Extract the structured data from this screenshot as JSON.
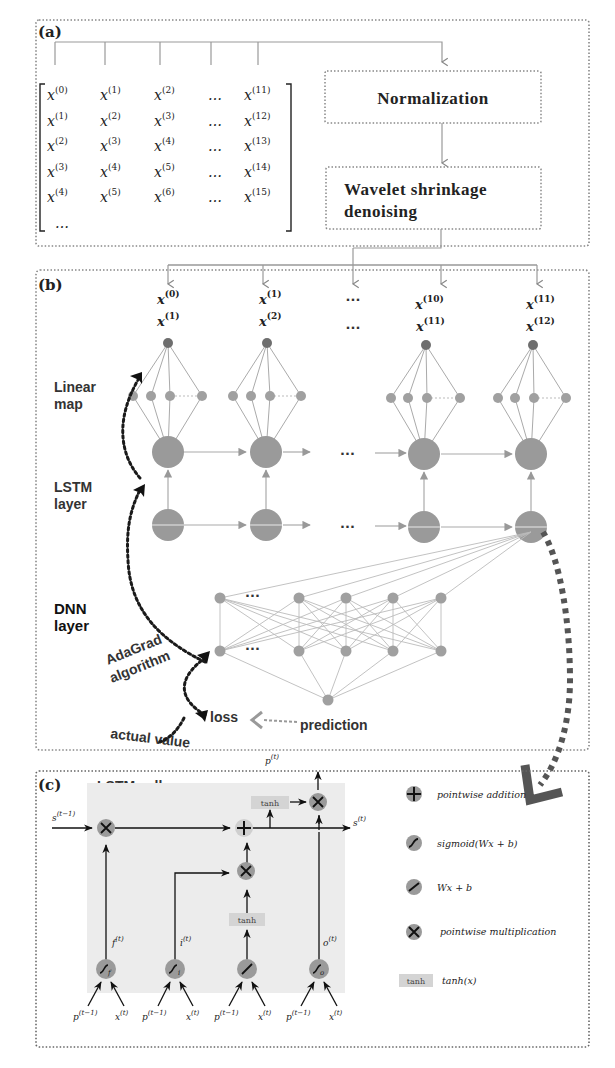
{
  "figure": {
    "panels": [
      {
        "id": "a",
        "label": "(a)"
      },
      {
        "id": "b",
        "label": "(b)"
      },
      {
        "id": "c",
        "label": "(c)"
      }
    ]
  },
  "panel_a": {
    "label": "(a)",
    "matrix": {
      "rows": [
        [
          "0",
          "1",
          "2",
          "…",
          "11"
        ],
        [
          "1",
          "2",
          "3",
          "…",
          "12"
        ],
        [
          "2",
          "3",
          "4",
          "…",
          "13"
        ],
        [
          "3",
          "4",
          "5",
          "…",
          "14"
        ],
        [
          "4",
          "5",
          "6",
          "…",
          "15"
        ]
      ],
      "trailing": "…",
      "variable": "x"
    },
    "boxes": {
      "normalization": "Normalization",
      "wavelet_line1": "Wavelet shrinkage",
      "wavelet_line2": "denoising"
    }
  },
  "panel_b": {
    "label": "(b)",
    "inputs": [
      {
        "top": "0",
        "bottom": "1"
      },
      {
        "top": "1",
        "bottom": "2"
      },
      {
        "top": "…",
        "bottom": "…"
      },
      {
        "top": "10",
        "bottom": "11"
      },
      {
        "top": "11",
        "bottom": "12"
      }
    ],
    "variable": "x",
    "labels": {
      "linear_map_1": "Linear",
      "linear_map_2": "map",
      "lstm_layer_1": "LSTM",
      "lstm_layer_2": "layer",
      "dnn_layer_1": "DNN",
      "dnn_layer_2": "layer",
      "adagrad_1": "AdaGrad",
      "adagrad_2": "algorithm",
      "loss": "loss",
      "prediction": "prediction",
      "actual_value": "actual value",
      "ellipsis": "···"
    }
  },
  "panel_c": {
    "label": "(c)",
    "title": "LSTM cell",
    "cell": {
      "state_in": "s",
      "state_in_sup": "(t−1)",
      "state_out": "s",
      "state_out_sup": "(t)",
      "output": "p",
      "output_sup": "(t)",
      "tanh_label": "tanh",
      "gates": [
        {
          "name": "forget",
          "label": "f",
          "sup": "(t)",
          "sub": "f"
        },
        {
          "name": "input",
          "label": "i",
          "sup": "(t)",
          "sub": "i"
        },
        {
          "name": "candidate",
          "label": "",
          "sup": "",
          "sub": ""
        },
        {
          "name": "output",
          "label": "o",
          "sup": "(t)",
          "sub": "o"
        }
      ],
      "inputs": {
        "prev": "p",
        "prev_sup": "(t−1)",
        "x": "x",
        "x_sup": "(t)"
      }
    },
    "legend": [
      {
        "icon": "plus",
        "text": "pointwise addition"
      },
      {
        "icon": "sigmoid",
        "text": "sigmoid(Wx + b)"
      },
      {
        "icon": "linear",
        "text": "Wx + b"
      },
      {
        "icon": "multiply",
        "text": "pointwise multiplication"
      },
      {
        "icon": "tanh",
        "box": "tanh",
        "text": "tanh(x)"
      }
    ]
  },
  "colors": {
    "node_gray": "#9a9a9a",
    "node_dark": "#6e6e6e",
    "line_gray": "#a8a8a8",
    "dotted_border": "#888888",
    "dark_arrow": "#1a1a1a",
    "cell_bg": "#ececec",
    "tanh_bg": "#d8d8d8"
  }
}
